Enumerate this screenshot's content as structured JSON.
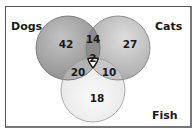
{
  "diagram": {
    "type": "venn-3",
    "sets": [
      {
        "name": "Dogs",
        "label": "Dogs",
        "only": "42",
        "color": "#9a9a9a"
      },
      {
        "name": "Cats",
        "label": "Cats",
        "only": "27",
        "color": "#b8b8b8"
      },
      {
        "name": "Fish",
        "label": "Fish",
        "only": "18",
        "color": "#ececec"
      }
    ],
    "regions": {
      "dogs_only": "42",
      "cats_only": "27",
      "fish_only": "18",
      "dogs_cats": "14",
      "dogs_fish": "20",
      "cats_fish": "10",
      "all_three": "2"
    },
    "colors": {
      "border": "#555555",
      "dogs_cats_overlap": "#8a8a8a",
      "dogs_fish_overlap": "#b0b0b0",
      "cats_fish_overlap": "#c4c4c4",
      "center": "#ffffff"
    }
  }
}
